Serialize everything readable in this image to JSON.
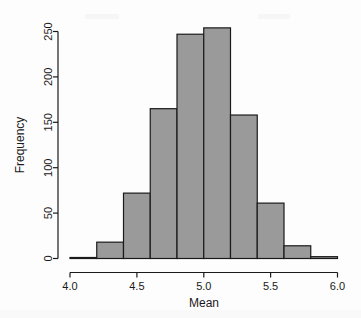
{
  "chart_data": {
    "type": "bar",
    "title": "",
    "subtitle": "",
    "xlabel": "Mean",
    "ylabel": "Frequency",
    "xlim": [
      4.0,
      6.0
    ],
    "ylim": [
      0,
      260
    ],
    "grid": false,
    "legend": null,
    "bin_width": 0.2,
    "bin_edges": [
      4.0,
      4.2,
      4.4,
      4.6,
      4.8,
      5.0,
      5.2,
      5.4,
      5.6,
      5.8,
      6.0
    ],
    "categories": [
      "4.0-4.2",
      "4.2-4.4",
      "4.4-4.6",
      "4.6-4.8",
      "4.8-5.0",
      "5.0-5.2",
      "5.2-5.4",
      "5.4-5.6",
      "5.6-5.8",
      "5.8-6.0"
    ],
    "values": [
      0,
      18,
      72,
      165,
      247,
      254,
      158,
      61,
      14,
      2
    ],
    "x_ticks": [
      4.0,
      4.5,
      5.0,
      5.5,
      6.0
    ],
    "x_tick_labels": [
      "4.0",
      "4.5",
      "5.0",
      "5.5",
      "6.0"
    ],
    "y_ticks": [
      0,
      50,
      100,
      150,
      200,
      250
    ],
    "y_tick_labels": [
      "0",
      "50",
      "100",
      "150",
      "200",
      "250"
    ],
    "bar_fill_color": "#9a9a9a",
    "bar_border_color": "#1a1a1a",
    "axis_color": "#1a1a1a",
    "background_color": "#ffffff"
  }
}
